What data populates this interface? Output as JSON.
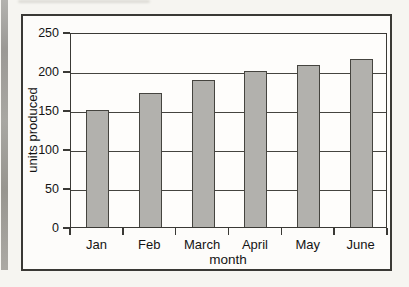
{
  "chart_data": {
    "type": "bar",
    "title": "",
    "categories": [
      "Jan",
      "Feb",
      "March",
      "April",
      "May",
      "June"
    ],
    "values": [
      150,
      172,
      188,
      200,
      208,
      216
    ],
    "xlabel": "month",
    "ylabel": "units produced",
    "ylim": [
      0,
      250
    ],
    "yticks": [
      0,
      50,
      100,
      150,
      200,
      250
    ],
    "grid": "horizontal",
    "legend": "none",
    "bar_color": "#b2b1ad",
    "bar_border_color": "#45443f",
    "axis_color": "#3a3935",
    "text_color": "#141414",
    "plot_background": "#fefdfb",
    "figure_background": "#fdfcfa",
    "page_background": "#f6f5f1"
  }
}
